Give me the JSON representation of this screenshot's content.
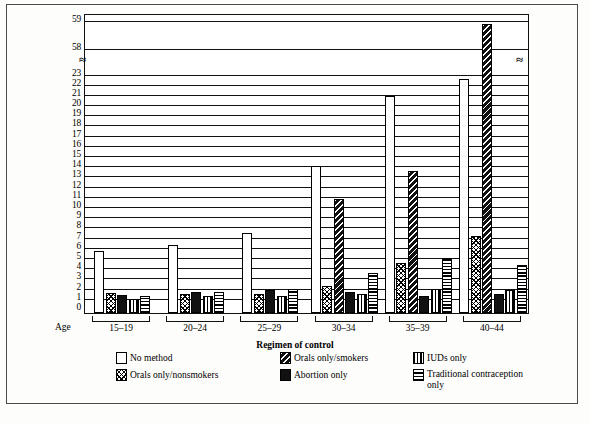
{
  "figure": {
    "axis_title": "Regimen of control",
    "age_axis_label": "Age",
    "caption": ""
  },
  "chart_data": {
    "type": "bar",
    "title": "",
    "subtitle": "",
    "xlabel": "Regimen of control",
    "ylabel": "",
    "grid": true,
    "legend_position": "bottom",
    "axis_break": {
      "present": true,
      "lower_max": 23,
      "upper_min": 58,
      "upper_max": 59,
      "note": "y-axis broken between 23 and 58"
    },
    "ylim": [
      0,
      59
    ],
    "ytick_labels": [
      "0",
      "1",
      "2",
      "3",
      "4",
      "5",
      "6",
      "7",
      "8",
      "9",
      "10",
      "11",
      "12",
      "13",
      "14",
      "15",
      "16",
      "17",
      "18",
      "19",
      "20",
      "21",
      "22",
      "23",
      "58",
      "59"
    ],
    "categories": [
      "15-19",
      "20-24",
      "25-29",
      "30-34",
      "35-39",
      "40-44"
    ],
    "series": [
      {
        "name": "No method",
        "pattern": "p-none",
        "values": [
          5.5,
          6.1,
          7.3,
          13.8,
          20.7,
          22.4
        ]
      },
      {
        "name": "Orals only/nonsmokers",
        "pattern": "p-xhatch",
        "values": [
          1.4,
          1.3,
          1.3,
          2.1,
          4.3,
          7.0
        ]
      },
      {
        "name": "Orals only/smokers",
        "pattern": "p-diag",
        "values": [
          null,
          null,
          null,
          10.6,
          13.3,
          58.8
        ]
      },
      {
        "name": "Abortion only",
        "pattern": "p-solid",
        "values": [
          1.2,
          1.5,
          1.7,
          1.5,
          1.1,
          1.3
        ]
      },
      {
        "name": "IUDs only",
        "pattern": "p-vert",
        "values": [
          0.8,
          1.1,
          1.1,
          1.3,
          1.8,
          1.7
        ]
      },
      {
        "name": "Traditional contraception only",
        "pattern": "p-horz",
        "values": [
          1.1,
          1.5,
          1.8,
          3.3,
          4.8,
          4.1
        ]
      }
    ]
  },
  "legend": {
    "items": [
      {
        "label": "No method",
        "swatch": "p-none"
      },
      {
        "label": "Orals only/smokers",
        "swatch": "p-diag"
      },
      {
        "label": "IUDs only",
        "swatch": "p-vert"
      },
      {
        "label": "Orals only/nonsmokers",
        "swatch": "p-xhatch"
      },
      {
        "label": "Abortion only",
        "swatch": "p-solid"
      },
      {
        "label": "Traditional contraception only",
        "swatch": "p-horz"
      }
    ]
  }
}
